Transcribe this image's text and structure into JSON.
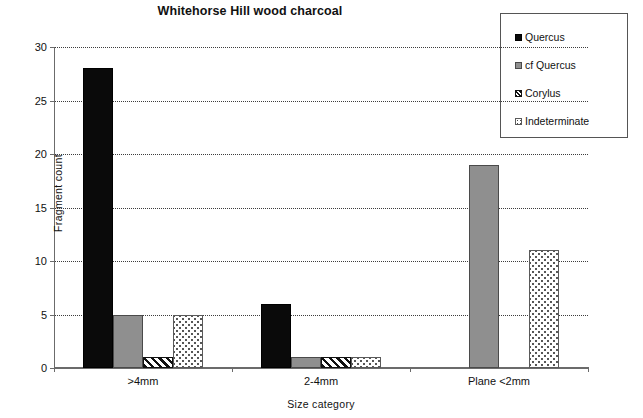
{
  "chart_data": {
    "type": "bar",
    "title": "Whitehorse Hill wood charcoal",
    "xlabel": "Size category",
    "ylabel": "Fragment count",
    "categories": [
      ">4mm",
      "2-4mm",
      "Plane <2mm"
    ],
    "series": [
      {
        "name": "Quercus",
        "values": [
          28,
          6,
          0
        ],
        "fill": "solid-black",
        "color": "#0a0a0a"
      },
      {
        "name": "cf Quercus",
        "values": [
          5,
          1,
          19
        ],
        "fill": "solid-gray",
        "color": "#8f8f8f"
      },
      {
        "name": "Corylus",
        "values": [
          1,
          1,
          0
        ],
        "fill": "diagonal-hatch",
        "color": "#111111"
      },
      {
        "name": "Indeterminate",
        "values": [
          5,
          1,
          11
        ],
        "fill": "dotted",
        "color": "#ffffff"
      }
    ],
    "ylim": [
      0,
      30
    ],
    "yticks": [
      0,
      5,
      10,
      15,
      20,
      25,
      30
    ],
    "grid": true,
    "legend_position": "top-right"
  },
  "legend": {
    "items": [
      {
        "label": "Quercus"
      },
      {
        "label": "cf Quercus"
      },
      {
        "label": "Corylus"
      },
      {
        "label": "Indeterminate"
      }
    ]
  },
  "axis": {
    "y_tick_labels": [
      "0",
      "5",
      "10",
      "15",
      "20",
      "25",
      "30"
    ],
    "x_tick_labels": [
      ">4mm",
      "2-4mm",
      "Plane <2mm"
    ]
  }
}
